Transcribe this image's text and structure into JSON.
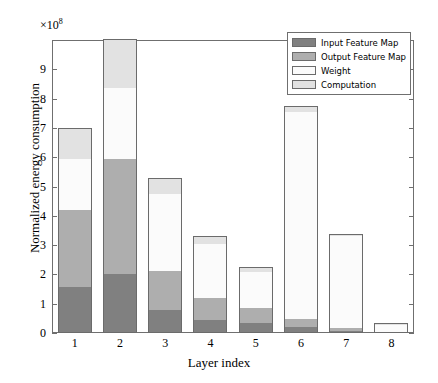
{
  "chart_data": {
    "type": "bar",
    "stacked": true,
    "title": "",
    "xlabel": "Layer index",
    "ylabel": "Normalized energy consumption",
    "y_exponent_label": "×10",
    "y_exponent_value": "8",
    "y_scale": 100000000.0,
    "categories": [
      "1",
      "2",
      "3",
      "4",
      "5",
      "6",
      "7",
      "8"
    ],
    "ylim": [
      0,
      10.0
    ],
    "yticks": [
      0,
      1,
      2,
      3,
      4,
      5,
      6,
      7,
      8,
      9
    ],
    "ytick_labels": [
      "0",
      "1",
      "2",
      "3",
      "4",
      "5",
      "6",
      "7",
      "8",
      "9"
    ],
    "grid": false,
    "legend_position": "upper right",
    "series": [
      {
        "name": "Input Feature Map",
        "color": "#808080",
        "values": [
          1.58,
          2.0,
          0.8,
          0.45,
          0.33,
          0.2,
          0.08,
          0.02
        ]
      },
      {
        "name": "Output Feature Map",
        "color": "#aeaeae",
        "values": [
          2.62,
          3.95,
          1.32,
          0.75,
          0.52,
          0.29,
          0.1,
          0.02
        ]
      },
      {
        "name": "Weight",
        "color": "#fbfbfb",
        "values": [
          1.75,
          2.42,
          2.63,
          1.85,
          1.22,
          7.07,
          3.14,
          0.24
        ]
      },
      {
        "name": "Computation",
        "color": "#e2e2e2",
        "values": [
          1.03,
          1.63,
          0.5,
          0.24,
          0.15,
          0.14,
          0.02,
          0.02
        ]
      }
    ],
    "stack_totals": [
      6.98,
      10.0,
      5.25,
      3.29,
      2.22,
      7.7,
      3.34,
      0.3
    ],
    "axis_color": "#6f6f6f",
    "edge_color": "#6b6b6b",
    "background": "#ffffff"
  },
  "legend": {
    "items": [
      {
        "label": "Input Feature Map",
        "color": "#808080"
      },
      {
        "label": "Output Feature Map",
        "color": "#aeaeae"
      },
      {
        "label": "Weight",
        "color": "#fbfbfb"
      },
      {
        "label": "Computation",
        "color": "#e2e2e2"
      }
    ]
  },
  "axes": {
    "x_title": "Layer index",
    "y_title": "Normalized energy consumption",
    "exponent_prefix": "×10",
    "exponent_power": "8"
  }
}
